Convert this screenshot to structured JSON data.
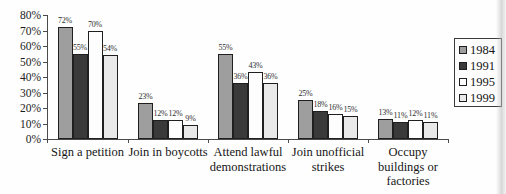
{
  "chart_data": {
    "type": "bar",
    "title": "",
    "xlabel": "",
    "ylabel": "",
    "ylim": [
      0,
      80
    ],
    "y_ticks": [
      0,
      10,
      20,
      30,
      40,
      50,
      60,
      70,
      80
    ],
    "y_tick_suffix": "%",
    "value_suffix": "%",
    "grid": false,
    "legend_position": "right",
    "categories": [
      {
        "id": "sign-a-petition",
        "lines": [
          "Sign a petition"
        ]
      },
      {
        "id": "join-in-boycotts",
        "lines": [
          "Join in boycotts"
        ]
      },
      {
        "id": "attend-lawful-demonstrations",
        "lines": [
          "Attend lawful",
          "demonstrations"
        ]
      },
      {
        "id": "join-unofficial-strikes",
        "lines": [
          "Join unofficial",
          "strikes"
        ]
      },
      {
        "id": "occupy-buildings-or-factories",
        "lines": [
          "Occupy",
          "buildings or",
          "factories"
        ]
      }
    ],
    "series": [
      {
        "name": "1984",
        "color": "#9e9e9e",
        "values": [
          72,
          23,
          55,
          25,
          13
        ]
      },
      {
        "name": "1991",
        "color": "#3a3a3a",
        "values": [
          55,
          12,
          36,
          18,
          11
        ]
      },
      {
        "name": "1995",
        "color": "#fdfdfd",
        "values": [
          70,
          12,
          43,
          16,
          12
        ]
      },
      {
        "name": "1999",
        "color": "#e9e9e9",
        "values": [
          54,
          9,
          36,
          15,
          11
        ]
      }
    ],
    "colors": {
      "axis": "#4a4a4a",
      "bar_border": "#1f1f1f",
      "text": "#1c1c1c"
    }
  }
}
